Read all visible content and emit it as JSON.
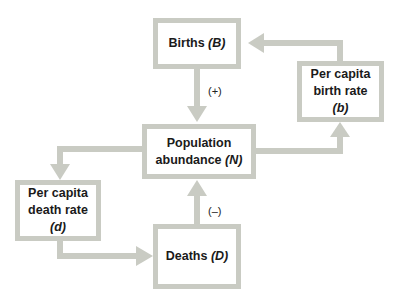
{
  "colors": {
    "box_border": "#c9cbc3",
    "arrow": "#c9cbc3",
    "text": "#1a1a1a",
    "background": "#ffffff"
  },
  "nodes": {
    "births": {
      "text": "Births ",
      "var": "(B)"
    },
    "birth_rate": {
      "line1": "Per capita",
      "line2": "birth rate",
      "var": "(b)"
    },
    "population": {
      "line1": "Population",
      "line2": "abundance ",
      "var": "(N)"
    },
    "death_rate": {
      "line1": "Per capita",
      "line2": "death rate",
      "var": "(d)"
    },
    "deaths": {
      "text": "Deaths ",
      "var": "(D)"
    }
  },
  "edges": [
    {
      "from": "births",
      "to": "population",
      "sign": "(+)"
    },
    {
      "from": "population",
      "to": "birth_rate",
      "sign": ""
    },
    {
      "from": "birth_rate",
      "to": "births",
      "sign": ""
    },
    {
      "from": "population",
      "to": "death_rate",
      "sign": ""
    },
    {
      "from": "death_rate",
      "to": "deaths",
      "sign": ""
    },
    {
      "from": "deaths",
      "to": "population",
      "sign": "(–)"
    }
  ],
  "labels": {
    "plus": "(+)",
    "minus": "(–)"
  }
}
